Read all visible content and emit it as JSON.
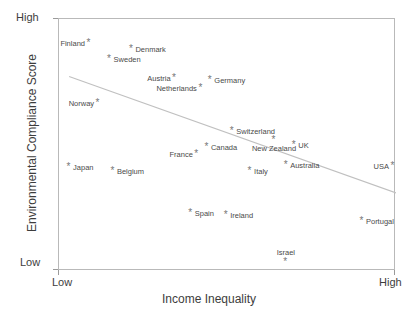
{
  "chart_data": {
    "type": "scatter",
    "title": "",
    "xlabel": "Income Inequality",
    "ylabel": "Environmental Compliance Score",
    "x_tick_labels": [
      "Low",
      "High"
    ],
    "y_tick_labels": [
      "Low",
      "High"
    ],
    "xlim": [
      0,
      1
    ],
    "ylim": [
      0,
      1
    ],
    "grid": false,
    "legend": "none",
    "marker_glyph": "*",
    "axis_color": "#b9b9b9",
    "point_color": "#777777",
    "label_color": "#4a4a4a",
    "trendline": {
      "present": true,
      "color": "#c0c0c0",
      "x_start": 0.03,
      "y_start": 0.772,
      "x_end": 1.0,
      "y_end": 0.31,
      "description": "downward-sloping least-squares fit"
    },
    "points": [
      {
        "label": "Finland",
        "x": 0.089,
        "y": 0.905,
        "label_pos": "left"
      },
      {
        "label": "Denmark",
        "x": 0.215,
        "y": 0.881,
        "label_pos": "right"
      },
      {
        "label": "Sweden",
        "x": 0.15,
        "y": 0.841,
        "label_pos": "right"
      },
      {
        "label": "Austria",
        "x": 0.343,
        "y": 0.766,
        "label_pos": "left"
      },
      {
        "label": "Germany",
        "x": 0.449,
        "y": 0.758,
        "label_pos": "right"
      },
      {
        "label": "Netherlands",
        "x": 0.421,
        "y": 0.726,
        "label_pos": "left"
      },
      {
        "label": "Norway",
        "x": 0.116,
        "y": 0.667,
        "label_pos": "left"
      },
      {
        "label": "Switzerland",
        "x": 0.514,
        "y": 0.556,
        "label_pos": "right"
      },
      {
        "label": "Canada",
        "x": 0.439,
        "y": 0.492,
        "label_pos": "right"
      },
      {
        "label": "New Zealand",
        "x": 0.638,
        "y": 0.52,
        "label_pos": "below"
      },
      {
        "label": "UK",
        "x": 0.698,
        "y": 0.5,
        "label_pos": "right"
      },
      {
        "label": "France",
        "x": 0.409,
        "y": 0.464,
        "label_pos": "left"
      },
      {
        "label": "Japan",
        "x": 0.03,
        "y": 0.413,
        "label_pos": "right"
      },
      {
        "label": "Belgium",
        "x": 0.16,
        "y": 0.397,
        "label_pos": "right"
      },
      {
        "label": "Italy",
        "x": 0.567,
        "y": 0.397,
        "label_pos": "right"
      },
      {
        "label": "Australia",
        "x": 0.674,
        "y": 0.421,
        "label_pos": "right"
      },
      {
        "label": "USA",
        "x": 0.991,
        "y": 0.417,
        "label_pos": "left"
      },
      {
        "label": "Spain",
        "x": 0.391,
        "y": 0.23,
        "label_pos": "right"
      },
      {
        "label": "Ireland",
        "x": 0.496,
        "y": 0.222,
        "label_pos": "right"
      },
      {
        "label": "Portugal",
        "x": 0.899,
        "y": 0.198,
        "label_pos": "right"
      },
      {
        "label": "Israel",
        "x": 0.673,
        "y": 0.034,
        "label_pos": "above"
      }
    ]
  }
}
